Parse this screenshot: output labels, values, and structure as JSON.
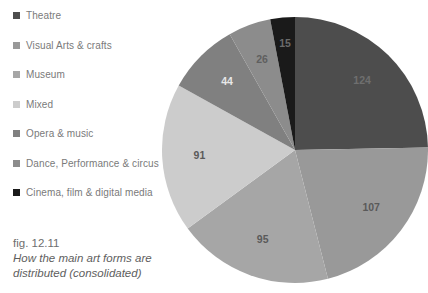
{
  "legend": {
    "items": [
      {
        "label": "Theatre",
        "color": "#4d4d4d"
      },
      {
        "label": "Visual Arts & crafts",
        "color": "#999999"
      },
      {
        "label": "Museum",
        "color": "#a6a6a6"
      },
      {
        "label": "Mixed",
        "color": "#cccccc"
      },
      {
        "label": "Opera & music",
        "color": "#808080"
      },
      {
        "label": "Dance, Performance & circus",
        "color": "#8c8c8c"
      },
      {
        "label": "Cinema, film & digital media",
        "color": "#1a1a1a"
      }
    ]
  },
  "caption": {
    "figure_number": "fig. 12.11",
    "text": "How the main art forms are distributed (consolidated)"
  },
  "chart_data": {
    "type": "pie",
    "title": "How the main art forms are distributed (consolidated)",
    "xlabel": "",
    "ylabel": "",
    "grid": false,
    "legend_position": "left",
    "start_angle_deg": 0,
    "direction": "clockwise",
    "total": 502,
    "categories": [
      "Theatre",
      "Visual Arts & crafts",
      "Museum",
      "Mixed",
      "Opera & music",
      "Dance, Performance & circus",
      "Cinema, film & digital media"
    ],
    "values": [
      124,
      107,
      95,
      91,
      44,
      26,
      15
    ],
    "colors": [
      "#4d4d4d",
      "#999999",
      "#a6a6a6",
      "#cccccc",
      "#808080",
      "#8c8c8c",
      "#1a1a1a"
    ],
    "label_colors": [
      "#6f6f6f",
      "#5a5a5a",
      "#5a5a5a",
      "#5a5a5a",
      "#e8e8e8",
      "#5f5f5f",
      "#6a6a6a"
    ],
    "slices": [
      {
        "name": "Theatre",
        "value": 124,
        "color": "#4d4d4d",
        "label": "124"
      },
      {
        "name": "Visual Arts & crafts",
        "value": 107,
        "color": "#999999",
        "label": "107"
      },
      {
        "name": "Museum",
        "value": 95,
        "color": "#a6a6a6",
        "label": "95"
      },
      {
        "name": "Mixed",
        "value": 91,
        "color": "#cccccc",
        "label": "91"
      },
      {
        "name": "Opera & music",
        "value": 44,
        "color": "#808080",
        "label": "44"
      },
      {
        "name": "Dance, Performance & circus",
        "value": 26,
        "color": "#8c8c8c",
        "label": "26"
      },
      {
        "name": "Cinema, film & digital media",
        "value": 15,
        "color": "#1a1a1a",
        "label": "15"
      }
    ]
  }
}
